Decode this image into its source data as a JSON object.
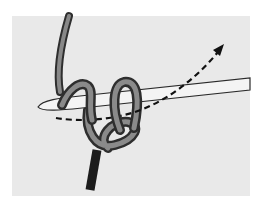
{
  "illustration": {
    "subject": "crochet-hook-with-yarn-loops",
    "colors": {
      "background": "#ffffff",
      "panel": "#e9e9e9",
      "yarn": "#7a7a7a",
      "yarn_dark": "#3a3a3a",
      "yarn_highlight": "#b5b5b5",
      "hook": "#f2f2f2",
      "hook_outline": "#2a2a2a",
      "tail": "#1c1c1c",
      "arrow": "#111111"
    },
    "arrow": {
      "style": "dashed",
      "direction": "up-right"
    }
  }
}
